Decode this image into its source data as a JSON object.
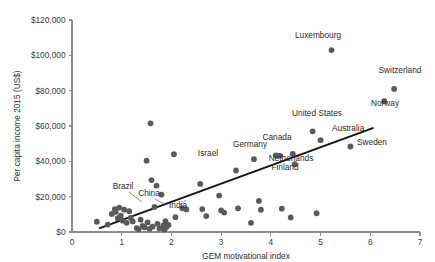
{
  "chart_data": {
    "type": "scatter",
    "title": "",
    "xlabel": "GEM motivational index",
    "ylabel": "Per capita income 2015 (US$)",
    "xlim": [
      0,
      7
    ],
    "ylim": [
      0,
      120000
    ],
    "grid": false,
    "legend": "none",
    "x_ticks": [
      "0",
      "1",
      "2",
      "3",
      "4",
      "5",
      "6",
      "7"
    ],
    "x_tick_values": [
      0,
      1,
      2,
      3,
      4,
      5,
      6,
      7
    ],
    "y_ticks": [
      "$0",
      "$20,000",
      "$40,000",
      "$60,000",
      "$80,000",
      "$100,000",
      "$120,000"
    ],
    "y_tick_values": [
      0,
      20000,
      40000,
      60000,
      80000,
      100000,
      120000
    ],
    "marker_color": "#5a5a5a",
    "trend_color": "#141414",
    "axis_color": "#8d8d8d",
    "trendline": {
      "label": "linear fit",
      "x0": 0.56,
      "y0": 2200,
      "x1": 6.05,
      "y1": 58800
    },
    "points": [
      {
        "x": 0.5,
        "y": 5800,
        "label": ""
      },
      {
        "x": 0.72,
        "y": 4200,
        "label": ""
      },
      {
        "x": 0.8,
        "y": 10200,
        "label": ""
      },
      {
        "x": 0.86,
        "y": 13000,
        "label": ""
      },
      {
        "x": 0.88,
        "y": 11400,
        "label": ""
      },
      {
        "x": 0.92,
        "y": 7800,
        "label": ""
      },
      {
        "x": 0.95,
        "y": 13800,
        "label": ""
      },
      {
        "x": 0.98,
        "y": 9200,
        "label": ""
      },
      {
        "x": 1.02,
        "y": 6400,
        "label": ""
      },
      {
        "x": 1.05,
        "y": 12600,
        "label": "Brazil"
      },
      {
        "x": 1.1,
        "y": 5200,
        "label": ""
      },
      {
        "x": 1.15,
        "y": 11800,
        "label": ""
      },
      {
        "x": 1.18,
        "y": 8000,
        "label": ""
      },
      {
        "x": 1.22,
        "y": 6000,
        "label": ""
      },
      {
        "x": 1.3,
        "y": 2200,
        "label": ""
      },
      {
        "x": 1.34,
        "y": 1500,
        "label": ""
      },
      {
        "x": 1.38,
        "y": 7000,
        "label": ""
      },
      {
        "x": 1.42,
        "y": 3400,
        "label": ""
      },
      {
        "x": 1.46,
        "y": 2600,
        "label": ""
      },
      {
        "x": 1.5,
        "y": 40400,
        "label": ""
      },
      {
        "x": 1.52,
        "y": 5400,
        "label": ""
      },
      {
        "x": 1.56,
        "y": 1800,
        "label": ""
      },
      {
        "x": 1.58,
        "y": 61500,
        "label": ""
      },
      {
        "x": 1.6,
        "y": 29400,
        "label": ""
      },
      {
        "x": 1.62,
        "y": 3000,
        "label": ""
      },
      {
        "x": 1.66,
        "y": 14200,
        "label": "China"
      },
      {
        "x": 1.7,
        "y": 26200,
        "label": ""
      },
      {
        "x": 1.72,
        "y": 4600,
        "label": ""
      },
      {
        "x": 1.76,
        "y": 2000,
        "label": ""
      },
      {
        "x": 1.8,
        "y": 21200,
        "label": ""
      },
      {
        "x": 1.84,
        "y": 3800,
        "label": ""
      },
      {
        "x": 1.86,
        "y": 1400,
        "label": ""
      },
      {
        "x": 1.88,
        "y": 6200,
        "label": "India"
      },
      {
        "x": 1.9,
        "y": 2800,
        "label": ""
      },
      {
        "x": 1.94,
        "y": 4000,
        "label": ""
      },
      {
        "x": 2.05,
        "y": 44000,
        "label": ""
      },
      {
        "x": 2.08,
        "y": 8400,
        "label": ""
      },
      {
        "x": 2.22,
        "y": 13400,
        "label": ""
      },
      {
        "x": 2.3,
        "y": 12800,
        "label": ""
      },
      {
        "x": 2.58,
        "y": 27200,
        "label": ""
      },
      {
        "x": 2.62,
        "y": 13000,
        "label": ""
      },
      {
        "x": 2.7,
        "y": 9000,
        "label": ""
      },
      {
        "x": 2.96,
        "y": 20600,
        "label": ""
      },
      {
        "x": 3.0,
        "y": 12200,
        "label": ""
      },
      {
        "x": 3.06,
        "y": 11000,
        "label": ""
      },
      {
        "x": 3.3,
        "y": 34800,
        "label": "Israel"
      },
      {
        "x": 3.34,
        "y": 13400,
        "label": ""
      },
      {
        "x": 3.6,
        "y": 5200,
        "label": ""
      },
      {
        "x": 3.66,
        "y": 41200,
        "label": "Germany"
      },
      {
        "x": 3.76,
        "y": 17600,
        "label": ""
      },
      {
        "x": 3.8,
        "y": 12600,
        "label": ""
      },
      {
        "x": 4.1,
        "y": 43400,
        "label": ""
      },
      {
        "x": 4.18,
        "y": 43200,
        "label": "Netherlands"
      },
      {
        "x": 4.22,
        "y": 13200,
        "label": ""
      },
      {
        "x": 4.4,
        "y": 8200,
        "label": ""
      },
      {
        "x": 4.44,
        "y": 44200,
        "label": "Canada"
      },
      {
        "x": 4.48,
        "y": 38400,
        "label": "Finland"
      },
      {
        "x": 4.92,
        "y": 10600,
        "label": ""
      },
      {
        "x": 5.0,
        "y": 52000,
        "label": "Australia"
      },
      {
        "x": 4.84,
        "y": 57000,
        "label": "United States"
      },
      {
        "x": 5.22,
        "y": 103000,
        "label": "Luxembourg"
      },
      {
        "x": 5.6,
        "y": 48400,
        "label": "Sweden"
      },
      {
        "x": 6.28,
        "y": 74000,
        "label": "Norway"
      },
      {
        "x": 6.48,
        "y": 81000,
        "label": "Switzerland"
      }
    ],
    "annotations": [
      {
        "text": "Luxembourg",
        "x": 318,
        "y": 38,
        "anchor": "middle"
      },
      {
        "text": "Switzerland",
        "x": 400,
        "y": 73,
        "anchor": "middle"
      },
      {
        "text": "Norway",
        "x": 385,
        "y": 106,
        "anchor": "middle"
      },
      {
        "text": "United States",
        "x": 317,
        "y": 116,
        "anchor": "middle"
      },
      {
        "text": "Australia",
        "x": 332,
        "y": 131,
        "anchor": "start"
      },
      {
        "text": "Sweden",
        "x": 357,
        "y": 145,
        "anchor": "start"
      },
      {
        "text": "Canada",
        "x": 277,
        "y": 140,
        "anchor": "middle"
      },
      {
        "text": "Germany",
        "x": 250,
        "y": 147,
        "anchor": "middle"
      },
      {
        "text": "Israel",
        "x": 208,
        "y": 156,
        "anchor": "middle"
      },
      {
        "text": "Netherlands",
        "x": 291,
        "y": 161,
        "anchor": "middle"
      },
      {
        "text": "Finland",
        "x": 285,
        "y": 170,
        "anchor": "middle"
      },
      {
        "text": "Brazil",
        "x": 123,
        "y": 189,
        "anchor": "middle"
      },
      {
        "text": "China",
        "x": 149,
        "y": 196,
        "anchor": "middle"
      },
      {
        "text": "India",
        "x": 178,
        "y": 208,
        "anchor": "middle"
      }
    ]
  }
}
